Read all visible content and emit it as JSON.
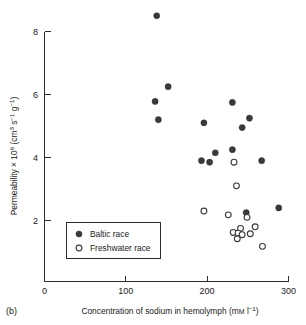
{
  "figure": {
    "panel_label": "(b)",
    "background": "#ffffff"
  },
  "chart_data": {
    "type": "scatter",
    "title": "",
    "xlabel": "Concentration of sodium in hemolymph (mM l⁻¹)",
    "ylabel": "Permeability × 10⁶ (cm³ s⁻¹ g⁻¹)",
    "xlim": [
      0,
      300
    ],
    "ylim": [
      0,
      8.8
    ],
    "xticks": [
      0,
      100,
      200,
      300
    ],
    "xtick_labels": [
      "0",
      "100",
      "200",
      "300"
    ],
    "yticks": [
      2,
      4,
      6,
      8
    ],
    "ytick_labels": [
      "2",
      "4",
      "6",
      "8"
    ],
    "grid": false,
    "legend_position": "lower-left",
    "series": [
      {
        "name": "Baltic race",
        "marker": "filled-circle",
        "color": "#3a3a3a",
        "points": [
          {
            "x": 138,
            "y": 8.5
          },
          {
            "x": 152,
            "y": 6.25
          },
          {
            "x": 136,
            "y": 5.78
          },
          {
            "x": 140,
            "y": 5.2
          },
          {
            "x": 231,
            "y": 5.75
          },
          {
            "x": 196,
            "y": 5.1
          },
          {
            "x": 252,
            "y": 5.25
          },
          {
            "x": 243,
            "y": 4.95
          },
          {
            "x": 231,
            "y": 4.25
          },
          {
            "x": 210,
            "y": 4.15
          },
          {
            "x": 193,
            "y": 3.9
          },
          {
            "x": 203,
            "y": 3.85
          },
          {
            "x": 267,
            "y": 3.9
          },
          {
            "x": 248,
            "y": 2.25
          },
          {
            "x": 288,
            "y": 2.4
          }
        ]
      },
      {
        "name": "Freshwater race",
        "marker": "open-circle",
        "color": "#3a3a3a",
        "points": [
          {
            "x": 233,
            "y": 3.85
          },
          {
            "x": 236,
            "y": 3.1
          },
          {
            "x": 196,
            "y": 2.3
          },
          {
            "x": 226,
            "y": 2.18
          },
          {
            "x": 249,
            "y": 2.1
          },
          {
            "x": 241,
            "y": 1.75
          },
          {
            "x": 259,
            "y": 1.8
          },
          {
            "x": 232,
            "y": 1.62
          },
          {
            "x": 238,
            "y": 1.6
          },
          {
            "x": 243,
            "y": 1.55
          },
          {
            "x": 253,
            "y": 1.58
          },
          {
            "x": 237,
            "y": 1.42
          },
          {
            "x": 268,
            "y": 1.18
          }
        ]
      }
    ]
  },
  "legend": {
    "entries": [
      {
        "label": "Baltic race",
        "marker": "filled-circle"
      },
      {
        "label": "Freshwater race",
        "marker": "open-circle"
      }
    ]
  },
  "axis_label_parts": {
    "y_prefix": "Permeability × 10",
    "y_exp1": "6",
    "y_mid": " (cm",
    "y_exp2": "3",
    "y_s": " s",
    "y_exp3": "−1",
    "y_g": " g",
    "y_exp4": "−1",
    "y_close": ")",
    "x_prefix": "Concentration of sodium in hemolymph (m",
    "x_m": "M",
    "x_l": " l",
    "x_exp": "−1",
    "x_close": ")"
  }
}
